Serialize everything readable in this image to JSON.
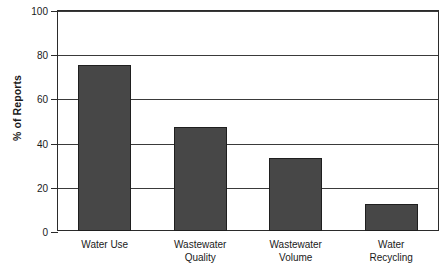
{
  "chart_data": {
    "type": "bar",
    "title": "",
    "subtitle": "",
    "xlabel": "",
    "ylabel": "% of Reports",
    "categories": [
      "Water Use",
      "Wastewater Quality",
      "Wastewater Volume",
      "Water Recycling"
    ],
    "category_lines": [
      [
        "Water Use"
      ],
      [
        "Wastewater",
        "Quality"
      ],
      [
        "Wastewater",
        "Volume"
      ],
      [
        "Water",
        "Recycling"
      ]
    ],
    "values": [
      75,
      47,
      33,
      12
    ],
    "ylim": [
      0,
      100
    ],
    "yticks": [
      0,
      20,
      40,
      60,
      80,
      100
    ],
    "ytick_labels": [
      "0",
      "20",
      "40",
      "60",
      "80",
      "100"
    ],
    "grid": true,
    "grid_axis": "y",
    "legend": false,
    "legend_position": "none",
    "bar_color": "#474747",
    "bar_edge_color": "#1f1f1f",
    "axis_color": "#2b2b2b",
    "grid_color": "#3a3a3a",
    "background_color": "#ffffff"
  }
}
